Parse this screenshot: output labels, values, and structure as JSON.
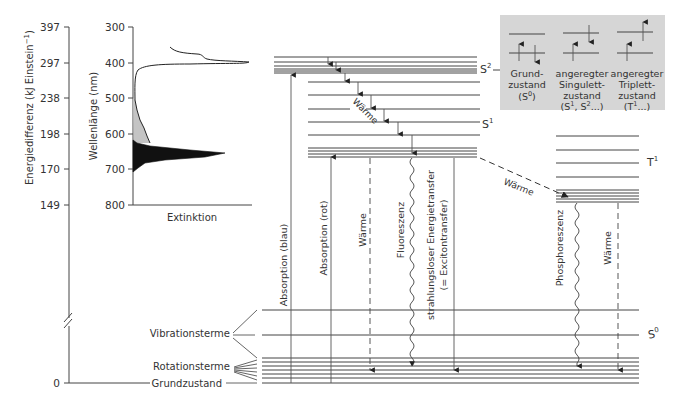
{
  "energy_axis": {
    "label": "Energiedifferenz (kJ Einstein",
    "label_sup": "−1",
    "label_close": ")",
    "ticks": [
      "397",
      "297",
      "238",
      "198",
      "170",
      "149",
      "0"
    ]
  },
  "spectrum": {
    "ylabel": "Wellenlänge (nm)",
    "xlabel": "Extinktion",
    "ticks": [
      "300",
      "400",
      "500",
      "600",
      "700",
      "800"
    ]
  },
  "states": {
    "s2": "S",
    "s2_sup": "2",
    "s1": "S",
    "s1_sup": "1",
    "t1": "T",
    "t1_sup": "1",
    "s0": "S",
    "s0_sup": "0"
  },
  "labels": {
    "waerme_cascade": "Wärme",
    "waerme_isc": "Wärme",
    "vibrationsterme": "Vibrationsterme",
    "rotationsterme": "Rotationsterme",
    "grundzustand": "Grundzustand"
  },
  "transitions": {
    "absorption_blau": "Absorption (blau)",
    "absorption_rot": "Absorption (rot)",
    "waerme": "Wärme",
    "fluoreszenz": "Fluoreszenz",
    "energietransfer_1": "strahlungsloser Energietransfer",
    "energietransfer_2": "(= Excitontransfer)",
    "phosphoreszenz": "Phosphoreszenz",
    "waerme_t": "Wärme"
  },
  "legend": {
    "ground": [
      "Grund-",
      "zustand",
      "(S",
      "0",
      ")"
    ],
    "singlet": [
      "angeregter",
      "Singulett-",
      "zustand",
      "(S",
      "1",
      ", S",
      "2",
      "...)"
    ],
    "triplet": [
      "angeregter",
      "Triplett-",
      "zustand",
      "(T",
      "1",
      "...)"
    ],
    "bg_color": "#d6d6d6"
  }
}
